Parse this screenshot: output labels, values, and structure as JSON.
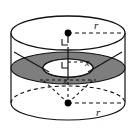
{
  "figure": {
    "type": "geometry-diagram",
    "canvas": {
      "width": 137,
      "height": 131
    },
    "colors": {
      "background": "#ffffff",
      "stroke": "#111111",
      "annulus_fill": "#7e7e7e",
      "solid_fill": "#ffffff",
      "point_fill": "#000000"
    },
    "solid": {
      "name": "cylinder",
      "top_ellipse": {
        "cx": 68,
        "cy": 33,
        "rx": 57,
        "ry": 17
      },
      "bottom_ellipse": {
        "cx": 68,
        "cy": 103,
        "rx": 57,
        "ry": 17
      },
      "left_side_x": 11,
      "right_side_x": 125
    },
    "cross_section": {
      "name": "annulus",
      "outer_ellipse": {
        "cx": 68,
        "cy": 68,
        "rx": 57,
        "ry": 16
      },
      "inner_ellipse": {
        "cx": 68,
        "cy": 68,
        "rx": 25,
        "ry": 9
      }
    },
    "points": [
      {
        "name": "top-center-point",
        "cx": 68,
        "cy": 33
      },
      {
        "name": "bottom-center-point",
        "cx": 68,
        "cy": 103
      }
    ],
    "labels": [
      {
        "id": "r_top",
        "text": "r",
        "x": 94,
        "y": 29
      },
      {
        "id": "x_middle",
        "text": "x",
        "x": 88,
        "y": 65
      },
      {
        "id": "x_lower",
        "text": "x",
        "x": 66,
        "y": 86
      },
      {
        "id": "r_bottom",
        "text": "r",
        "x": 96,
        "y": 114
      }
    ],
    "leader_lines": [
      {
        "name": "top-radius-line",
        "x1": 68,
        "y1": 33,
        "x2": 125,
        "y2": 33,
        "style": "dashed"
      },
      {
        "name": "center-axis-line",
        "x1": 68,
        "y1": 33,
        "x2": 68,
        "y2": 80,
        "style": "solid"
      },
      {
        "name": "mid-radius-line",
        "x1": 68,
        "y1": 62,
        "x2": 93,
        "y2": 62,
        "style": "dashed"
      },
      {
        "name": "bottom-radius-line",
        "x1": 68,
        "y1": 103,
        "x2": 125,
        "y2": 103,
        "style": "dashed"
      },
      {
        "name": "slant-line-left",
        "x1": 68,
        "y1": 103,
        "x2": 40,
        "y2": 78,
        "style": "dashed"
      },
      {
        "name": "slant-line-mid",
        "x1": 68,
        "y1": 103,
        "x2": 68,
        "y2": 80,
        "style": "dashed"
      },
      {
        "name": "slant-line-right",
        "x1": 68,
        "y1": 103,
        "x2": 96,
        "y2": 78,
        "style": "dashed"
      },
      {
        "name": "cone-edge-left",
        "x1": 14,
        "y1": 52,
        "x2": 50,
        "y2": 73,
        "style": "solid"
      },
      {
        "name": "cone-edge-right",
        "x1": 122,
        "y1": 52,
        "x2": 86,
        "y2": 73,
        "style": "solid"
      }
    ],
    "right_angle_marks": [
      {
        "name": "right-angle-top",
        "x": 68,
        "y": 33,
        "size": 6
      },
      {
        "name": "right-angle-mid",
        "x": 68,
        "y": 62,
        "size": 6
      }
    ]
  }
}
